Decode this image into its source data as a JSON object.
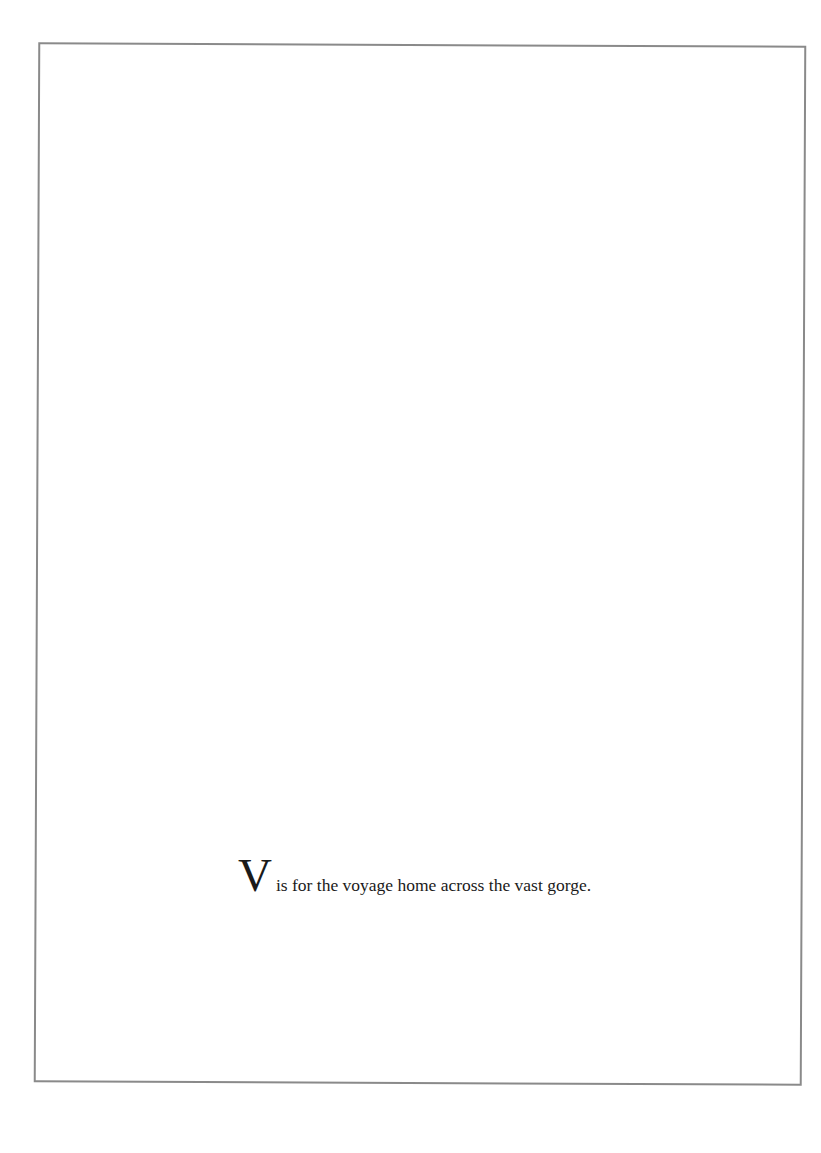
{
  "page": {
    "caption": {
      "initial": "V",
      "text": "is for the voyage home across the vast gorge."
    },
    "colors": {
      "frame": "#8a8a8a",
      "text": "#1a1a1a",
      "background": "#ffffff"
    }
  }
}
